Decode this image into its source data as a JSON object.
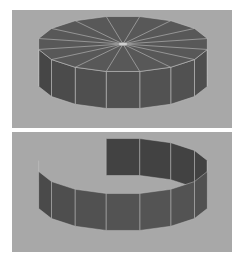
{
  "figure": {
    "panels": [
      {
        "id": "top",
        "subject": "solid-cylinder",
        "segments": 16,
        "background": "#a8a8a8",
        "fill_top": "#585858",
        "fill_side": "#4e4e4e",
        "edge_color": "#bdbdbd"
      },
      {
        "id": "bottom",
        "subject": "open-ring-wall",
        "segments": 16,
        "background": "#a8a8a8",
        "fill_side": "#4f4f4f",
        "edge_color": "#bdbdbd"
      }
    ]
  }
}
